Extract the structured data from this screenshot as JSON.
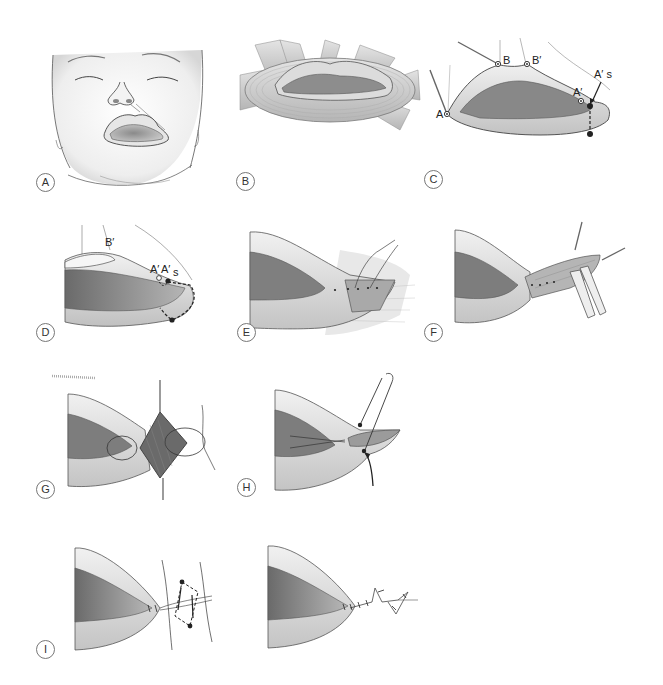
{
  "figure": {
    "panels": [
      {
        "id": "A",
        "label": "A",
        "content": "infant face with lateral facial cleft / macrostomia"
      },
      {
        "id": "B",
        "label": "B",
        "content": "orbicularis oris muscle fibers around mouth"
      },
      {
        "id": "C",
        "label": "C",
        "content": "marking points on lips",
        "markers": [
          "A",
          "B",
          "B′",
          "A′",
          "A′ s"
        ]
      },
      {
        "id": "D",
        "label": "D",
        "content": "incision design at commissure",
        "markers": [
          "B′",
          "A′",
          "A′",
          "s"
        ]
      },
      {
        "id": "E",
        "label": "E",
        "content": "mucosal closure with sutures"
      },
      {
        "id": "F",
        "label": "F",
        "content": "muscle dissection with forceps and hooks"
      },
      {
        "id": "G",
        "label": "G",
        "content": "muscle overlap suture"
      },
      {
        "id": "H",
        "label": "H",
        "content": "subcutaneous closure with arrow"
      },
      {
        "id": "I",
        "label": "I",
        "content": "Z-plasty design on skin"
      },
      {
        "id": "J",
        "label": "",
        "content": "final skin closure with Z-plasty"
      }
    ]
  },
  "colors": {
    "line": "#2a2a2a",
    "skin_light": "#efefef",
    "skin_mid": "#cfcfcf",
    "skin_dark": "#8a8a8a",
    "mouth_dark": "#6e6e6e",
    "muscle": "#9a9a9a"
  }
}
